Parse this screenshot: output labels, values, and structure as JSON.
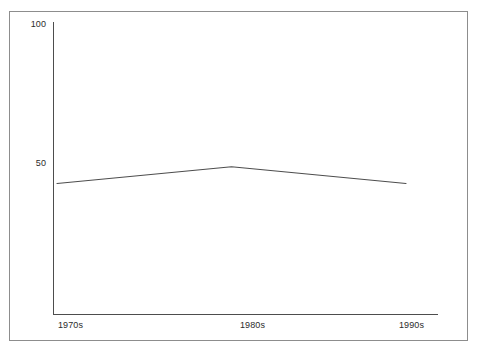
{
  "chart_data": {
    "type": "line",
    "title": "",
    "subtitle": "",
    "xlabel": "",
    "ylabel": "",
    "categories": [
      "1970s",
      "1980s",
      "1990s"
    ],
    "series": [
      {
        "name": "",
        "values": [
          43,
          49,
          43
        ]
      }
    ],
    "x_tick_labels": [
      "1970s",
      "1980s",
      "1990s"
    ],
    "y_tick_labels": [
      "100",
      "50"
    ],
    "y_tick_values": [
      100,
      50
    ],
    "ylim": [
      0,
      100
    ],
    "grid": false,
    "legend": false,
    "legend_position": "none",
    "markers": false,
    "annotations": [],
    "colors": {
      "line": "#4d4d4d",
      "axis": "#4d4d4d",
      "frame": "#8d8d8d",
      "text": "#2b2b2b",
      "background": "#ffffff"
    }
  },
  "axes": {
    "y_ticks": [
      {
        "label": "100",
        "value": 100
      },
      {
        "label": "50",
        "value": 50
      }
    ],
    "x_ticks": [
      {
        "label": "1970s"
      },
      {
        "label": "1980s"
      },
      {
        "label": "1990s"
      }
    ]
  }
}
